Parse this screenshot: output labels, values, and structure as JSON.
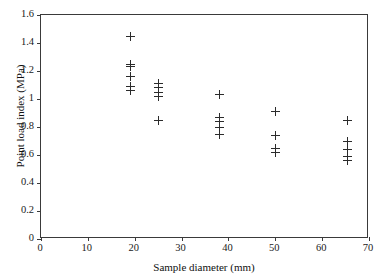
{
  "chart_data": {
    "type": "scatter",
    "title": "",
    "xlabel": "Sample diameter (mm)",
    "ylabel": "Point load index (MPa)",
    "xlim": [
      0,
      70
    ],
    "ylim": [
      0,
      1.6
    ],
    "xticks": [
      0,
      10,
      20,
      30,
      40,
      50,
      60,
      70
    ],
    "xtick_labels": [
      "0",
      "10",
      "20",
      "30",
      "40",
      "50",
      "60",
      "70"
    ],
    "yticks": [
      0,
      0.2,
      0.4,
      0.6,
      0.8,
      1.0,
      1.2,
      1.4,
      1.6
    ],
    "ytick_labels": [
      "0",
      "0.2",
      "0.4",
      "0.6",
      "0.8",
      "1",
      "1.2",
      "1.4",
      "1.6"
    ],
    "grid": false,
    "legend": false,
    "marker": "plus",
    "marker_color": "#2b2b2b",
    "series": [
      {
        "name": "Point load index vs sample diameter",
        "points": [
          {
            "x": 19.0,
            "y": 1.45
          },
          {
            "x": 19.0,
            "y": 1.25
          },
          {
            "x": 19.0,
            "y": 1.23
          },
          {
            "x": 19.0,
            "y": 1.16
          },
          {
            "x": 19.0,
            "y": 1.09
          },
          {
            "x": 19.0,
            "y": 1.06
          },
          {
            "x": 25.0,
            "y": 1.11
          },
          {
            "x": 25.0,
            "y": 1.08
          },
          {
            "x": 25.0,
            "y": 1.05
          },
          {
            "x": 25.0,
            "y": 1.02
          },
          {
            "x": 25.0,
            "y": 0.85
          },
          {
            "x": 38.0,
            "y": 1.03
          },
          {
            "x": 38.0,
            "y": 0.87
          },
          {
            "x": 38.0,
            "y": 0.84
          },
          {
            "x": 38.0,
            "y": 0.8
          },
          {
            "x": 38.0,
            "y": 0.75
          },
          {
            "x": 50.0,
            "y": 0.91
          },
          {
            "x": 50.0,
            "y": 0.74
          },
          {
            "x": 50.0,
            "y": 0.65
          },
          {
            "x": 50.0,
            "y": 0.62
          },
          {
            "x": 65.5,
            "y": 0.85
          },
          {
            "x": 65.5,
            "y": 0.7
          },
          {
            "x": 65.5,
            "y": 0.64
          },
          {
            "x": 65.5,
            "y": 0.59
          },
          {
            "x": 65.5,
            "y": 0.56
          }
        ]
      }
    ]
  }
}
